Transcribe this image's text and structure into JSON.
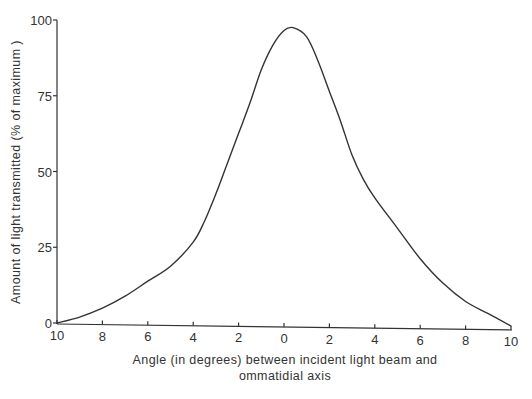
{
  "chart_data": {
    "type": "line",
    "title": "",
    "xlabel": "Angle (in degrees) between incident light beam and ommatidial axis",
    "xlabel_lines": [
      "Angle (in degrees) between incident light beam and",
      "ommatidial axis"
    ],
    "ylabel": "Amount of light transmitted (% of maximum )",
    "x_tick_labels": [
      "10",
      "8",
      "6",
      "4",
      "2",
      "0",
      "2",
      "4",
      "6",
      "8",
      "10"
    ],
    "x_tick_values": [
      -10,
      -8,
      -6,
      -4,
      -2,
      0,
      2,
      4,
      6,
      8,
      10
    ],
    "y_tick_labels": [
      "0",
      "25",
      "50",
      "75",
      "100"
    ],
    "y_tick_values": [
      0,
      25,
      50,
      75,
      100
    ],
    "xlim": [
      -10,
      10
    ],
    "ylim": [
      0,
      100
    ],
    "grid": false,
    "legend": null,
    "series": [
      {
        "name": "Light transmitted",
        "color": "#333333",
        "x": [
          -10,
          -9,
          -8,
          -7,
          -6,
          -5,
          -4,
          -3.5,
          -3,
          -2.5,
          -2,
          -1.5,
          -1,
          -0.5,
          0,
          0.4,
          1,
          1.5,
          2,
          2.5,
          3,
          3.5,
          4,
          5,
          6,
          7,
          8,
          9,
          10
        ],
        "y": [
          0,
          2,
          5,
          9,
          14,
          19,
          27,
          34,
          43,
          53,
          63,
          73,
          84,
          92,
          97,
          98,
          95,
          87,
          77,
          67,
          56,
          48,
          42,
          32,
          22,
          14,
          8,
          4,
          0
        ]
      }
    ]
  }
}
